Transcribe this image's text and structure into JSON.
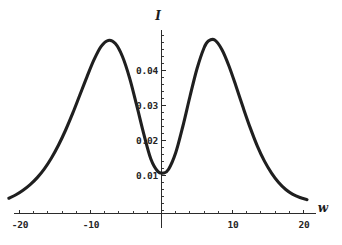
{
  "chart_data": {
    "type": "line",
    "title": "",
    "subtitle": "",
    "xlabel": "w",
    "ylabel": "I",
    "xlim": [
      -21.5,
      21.0
    ],
    "ylim": [
      0.0,
      0.0525
    ],
    "grid": false,
    "legend": null,
    "annotations": [],
    "x_ticks": [
      -20,
      -10,
      10,
      20
    ],
    "x_tick_labels": [
      "-20",
      "-10",
      "10",
      "20"
    ],
    "x_minor_tick_step": 2,
    "y_ticks": [
      0.01,
      0.02,
      0.03,
      0.04
    ],
    "y_tick_labels": [
      "0.01",
      "0.02",
      "0.03",
      "0.04"
    ],
    "y_minor_tick_step": 0.002,
    "series": [
      {
        "name": "I(w)",
        "color": "#1f1f1f",
        "x": [
          -21.5,
          -20.5,
          -19.5,
          -18.5,
          -17.5,
          -16.5,
          -15.5,
          -14.5,
          -13.5,
          -12.5,
          -11.5,
          -10.5,
          -9.5,
          -8.5,
          -7.5,
          -6.5,
          -5.5,
          -4.5,
          -3.5,
          -2.5,
          -1.5,
          -0.5,
          0.3,
          1.0,
          2.0,
          3.0,
          4.0,
          5.0,
          6.0,
          6.6,
          7.5,
          8.5,
          9.5,
          10.5,
          11.5,
          12.5,
          13.5,
          14.5,
          15.5,
          16.5,
          17.5,
          18.5,
          19.5,
          20.5
        ],
        "y": [
          0.0035,
          0.0045,
          0.0058,
          0.0074,
          0.0094,
          0.0119,
          0.015,
          0.0187,
          0.023,
          0.0278,
          0.033,
          0.0382,
          0.0431,
          0.0469,
          0.0486,
          0.0477,
          0.044,
          0.0379,
          0.0301,
          0.0219,
          0.0147,
          0.0111,
          0.0107,
          0.0118,
          0.0165,
          0.024,
          0.0325,
          0.0405,
          0.0465,
          0.0484,
          0.0487,
          0.046,
          0.0413,
          0.0355,
          0.0294,
          0.0236,
          0.0184,
          0.0141,
          0.0107,
          0.008,
          0.006,
          0.0046,
          0.0037,
          0.0031
        ]
      }
    ],
    "features": {
      "left_peak_w": -7.5,
      "left_peak_I": 0.0486,
      "right_peak_w": 6.8,
      "right_peak_I": 0.0488,
      "minimum_w": 0.3,
      "minimum_I": 0.0107
    }
  }
}
